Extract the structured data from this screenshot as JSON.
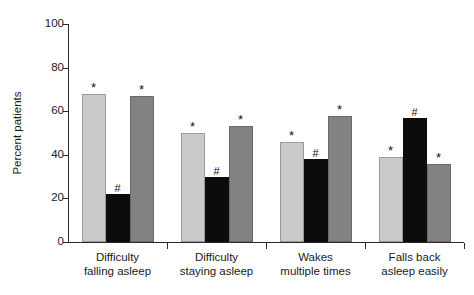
{
  "chart_data": {
    "type": "bar",
    "title": "",
    "subtitle": "",
    "xlabel": "",
    "ylabel": "Percent patients",
    "ylim": [
      0,
      100
    ],
    "yticks": [
      0,
      20,
      40,
      60,
      80,
      100
    ],
    "grid": false,
    "legend": "none",
    "categories": [
      "Difficulty falling asleep",
      "Difficulty staying asleep",
      "Wakes multiple times",
      "Falls back asleep easily"
    ],
    "category_lines": [
      [
        "Difficulty",
        "falling asleep"
      ],
      [
        "Difficulty",
        "staying asleep"
      ],
      [
        "Wakes",
        "multiple times"
      ],
      [
        "Falls back",
        "asleep easily"
      ]
    ],
    "series": [
      {
        "name": "light-gray",
        "color": "#cacaca",
        "values": [
          68,
          50,
          46,
          39
        ],
        "annotations": [
          "*",
          "*",
          "*",
          "*"
        ]
      },
      {
        "name": "black",
        "color": "#0c0c0c",
        "values": [
          22,
          30,
          38,
          57
        ],
        "annotations": [
          "#",
          "#",
          "#",
          "#"
        ]
      },
      {
        "name": "dark-gray",
        "color": "#828282",
        "values": [
          67,
          53,
          58,
          36
        ],
        "annotations": [
          "*",
          "*",
          "*",
          "*"
        ]
      }
    ]
  },
  "axis": {
    "y_title": "Percent patients",
    "y_tick_labels": [
      "0",
      "20",
      "40",
      "60",
      "80",
      "100"
    ]
  },
  "colors": {
    "light_gray": "#cacaca",
    "black": "#0c0c0c",
    "dark_gray": "#828282",
    "axis": "#2a2a2a",
    "text": "#1a1a1a",
    "background": "#ffffff"
  }
}
